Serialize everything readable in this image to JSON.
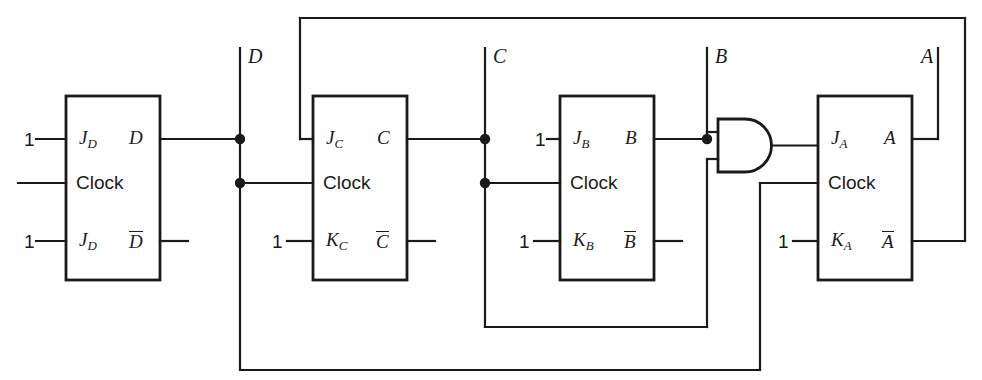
{
  "diagram": {
    "stroke_color": "#1a1a1a",
    "background_color": "#ffffff",
    "width": 982,
    "height": 380
  },
  "flipflops": [
    {
      "id": "ff-d",
      "j_label": "J",
      "j_sub": "D",
      "clock_label": "Clock",
      "k_label": "J",
      "k_sub": "D",
      "q_label": "D",
      "qbar_label": "D",
      "j_input_value": "1",
      "k_input_value": "1",
      "box": {
        "x": 66,
        "y": 96,
        "w": 94,
        "h": 184
      }
    },
    {
      "id": "ff-c",
      "j_label": "J",
      "j_sub": "C",
      "clock_label": "Clock",
      "k_label": "K",
      "k_sub": "C",
      "q_label": "C",
      "qbar_label": "C",
      "j_input_value": "",
      "k_input_value": "1",
      "box": {
        "x": 313,
        "y": 96,
        "w": 94,
        "h": 184
      }
    },
    {
      "id": "ff-b",
      "j_label": "J",
      "j_sub": "B",
      "clock_label": "Clock",
      "k_label": "K",
      "k_sub": "B",
      "q_label": "B",
      "qbar_label": "B",
      "j_input_value": "1",
      "k_input_value": "1",
      "box": {
        "x": 560,
        "y": 96,
        "w": 94,
        "h": 184
      }
    },
    {
      "id": "ff-a",
      "j_label": "J",
      "j_sub": "A",
      "clock_label": "Clock",
      "k_label": "K",
      "k_sub": "A",
      "q_label": "A",
      "qbar_label": "A",
      "j_input_value": "1",
      "k_input_value": "1",
      "box": {
        "x": 818,
        "y": 96,
        "w": 94,
        "h": 184
      }
    }
  ],
  "gate": {
    "id": "and-gate",
    "type": "AND",
    "label": ""
  },
  "net_labels": [
    {
      "name": "net-label-d",
      "text": "D",
      "x": 248,
      "y": 46
    },
    {
      "name": "net-label-c",
      "text": "C",
      "x": 493,
      "y": 46
    },
    {
      "name": "net-label-b",
      "text": "B",
      "x": 715,
      "y": 46
    },
    {
      "name": "net-label-a",
      "text": "A",
      "x": 921,
      "y": 46
    }
  ],
  "constant_inputs": [
    {
      "name": "const-jd",
      "value": "1",
      "x": 24,
      "y": 130
    },
    {
      "name": "const-kd",
      "value": "1",
      "x": 24,
      "y": 232
    },
    {
      "name": "const-kc",
      "value": "1",
      "x": 272,
      "y": 232
    },
    {
      "name": "const-jb",
      "value": "1",
      "x": 535,
      "y": 130
    },
    {
      "name": "const-kb",
      "value": "1",
      "x": 519,
      "y": 232
    },
    {
      "name": "const-ka",
      "value": "1",
      "x": 778,
      "y": 232
    }
  ]
}
